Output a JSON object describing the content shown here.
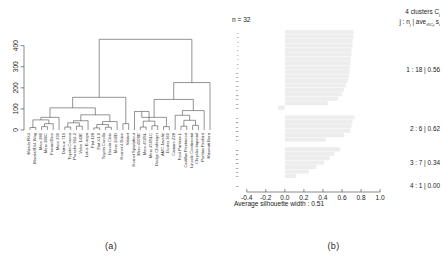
{
  "figure": {
    "panel_a_caption": "(a)",
    "panel_b_caption": "(b)"
  },
  "dendrogram": {
    "title": "",
    "ylabel": "",
    "y_ticks": [
      "0",
      "100",
      "200",
      "300",
      "400"
    ],
    "y_tick_values": [
      0,
      100,
      200,
      300,
      400
    ],
    "ylim": [
      0,
      460
    ],
    "leaves": [
      "Mazda RX4",
      "Mazda RX4 Wag",
      "Merc 280",
      "Merc 280C",
      "Ferrari Dino",
      "Merc 230",
      "Datsun 710",
      "Toyota Corona",
      "Porsche 914-2",
      "Volvo 142E",
      "Lotus Europa",
      "Fiat 128",
      "Fiat X1-9",
      "Toyota Corolla",
      "Honda Civic",
      "Merc 240D",
      "Hornet 4 Drive",
      "Valiant",
      "Hornet Sportabout",
      "Merc 450SE",
      "Merc 450SL",
      "Merc 450SLC",
      "Dodge Challenger",
      "AMC Javelin",
      "Duster 360",
      "Camaro Z28",
      "Ford Pantera L",
      "Cadillac Fleetwood",
      "Lincoln Continental",
      "Chrysler Imperial",
      "Pontiac Firebird",
      "Maserati Bora"
    ]
  },
  "silhouette": {
    "n_label": "n = 32",
    "header_line1": "4 clusters C",
    "header_line1_sub": "j",
    "header_line2_a": "j : n",
    "header_line2_sub1": "j",
    "header_line2_b": " | ave",
    "header_line2_sub2": "i∈C",
    "header_line2_sub3": "j",
    "header_line2_c": " s",
    "header_line2_sub4": "i",
    "footer": "Average silhouette width : 0.51",
    "average_width": 0.51,
    "x_ticks": [
      "-0.4",
      "-0.2",
      "0.0",
      "0.2",
      "0.4",
      "0.6",
      "0.8",
      "1.0"
    ],
    "x_tick_values": [
      -0.4,
      -0.2,
      0.0,
      0.2,
      0.4,
      0.6,
      0.8,
      1.0
    ],
    "xlim": [
      -0.45,
      1.02
    ],
    "bar_color": "#ededed",
    "cluster_labels": [
      "1 : 18 | 0.56",
      "2 : 6 | 0.62",
      "3 : 7 | 0.34",
      "4 : 1 | 0.00"
    ],
    "clusters": [
      {
        "id": 1,
        "size": 18,
        "avg": 0.56
      },
      {
        "id": 2,
        "size": 6,
        "avg": 0.62
      },
      {
        "id": 3,
        "size": 7,
        "avg": 0.34
      },
      {
        "id": 4,
        "size": 1,
        "avg": 0.0
      }
    ],
    "row_indices": [
      "1",
      "2",
      "3",
      "4",
      "5",
      "6",
      "7",
      "8",
      "9",
      "10",
      "11",
      "12",
      "13",
      "14",
      "15",
      "16",
      "17",
      "18",
      "19",
      "20",
      "21",
      "22",
      "23",
      "24",
      "25",
      "26",
      "27",
      "28",
      "29",
      "30",
      "31",
      "32"
    ],
    "values": [
      0.72,
      0.72,
      0.71,
      0.71,
      0.7,
      0.7,
      0.69,
      0.69,
      0.68,
      0.68,
      0.67,
      0.66,
      0.64,
      0.62,
      0.6,
      0.56,
      0.45,
      -0.07,
      0.73,
      0.71,
      0.7,
      0.69,
      0.62,
      0.43,
      0.58,
      0.52,
      0.47,
      0.41,
      0.33,
      0.25,
      0.12,
      0.0
    ]
  },
  "chart_data": {
    "type": "bar",
    "xlabel": "Average silhouette width : 0.51",
    "ylabel": "",
    "xlim": [
      -0.45,
      1.02
    ],
    "grid": false,
    "legend": "right",
    "categories": [
      "1",
      "2",
      "3",
      "4",
      "5",
      "6",
      "7",
      "8",
      "9",
      "10",
      "11",
      "12",
      "13",
      "14",
      "15",
      "16",
      "17",
      "18",
      "19",
      "20",
      "21",
      "22",
      "23",
      "24",
      "25",
      "26",
      "27",
      "28",
      "29",
      "30",
      "31",
      "32"
    ],
    "values": [
      0.72,
      0.72,
      0.71,
      0.71,
      0.7,
      0.7,
      0.69,
      0.69,
      0.68,
      0.68,
      0.67,
      0.66,
      0.64,
      0.62,
      0.6,
      0.56,
      0.45,
      -0.07,
      0.73,
      0.71,
      0.7,
      0.69,
      0.62,
      0.43,
      0.58,
      0.52,
      0.47,
      0.41,
      0.33,
      0.25,
      0.12,
      0.0
    ],
    "annotations": [
      "n = 32",
      "1 : 18 | 0.56",
      "2 : 6 | 0.62",
      "3 : 7 | 0.34",
      "4 : 1 | 0.00"
    ],
    "secondary": {
      "type": "dendrogram",
      "ylim": [
        0,
        460
      ],
      "yticks": [
        0,
        100,
        200,
        300,
        400
      ],
      "leaf_count": 32
    }
  }
}
